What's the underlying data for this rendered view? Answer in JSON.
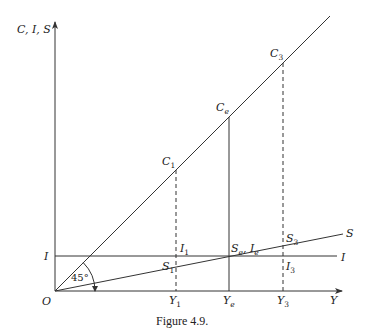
{
  "figure": {
    "caption": "Figure 4.9.",
    "y_axis_label": "C, I, S",
    "x_axis_label": "Y",
    "origin_label": "O",
    "angle_label": "45°",
    "i_axis_label": "I",
    "lines": {
      "consumption": {
        "name": "C",
        "description": "45-degree line"
      },
      "saving": {
        "name": "S",
        "end_label": "S"
      },
      "investment": {
        "name": "I",
        "end_label": "I"
      }
    },
    "points": {
      "c1": {
        "base": "C",
        "sub": "1"
      },
      "ce": {
        "base": "C",
        "sub": "e"
      },
      "c3": {
        "base": "C",
        "sub": "3"
      },
      "i1": {
        "base": "I",
        "sub": "1"
      },
      "s1": {
        "base": "S",
        "sub": "1"
      },
      "se_ie": {
        "base1": "S",
        "sub1": "e",
        "sep": ", ",
        "base2": "I",
        "sub2": "e"
      },
      "s3": {
        "base": "S",
        "sub": "3"
      },
      "i3": {
        "base": "I",
        "sub": "3"
      }
    },
    "x_ticks": [
      {
        "base": "Y",
        "sub": "1"
      },
      {
        "base": "Y",
        "sub": "e"
      },
      {
        "base": "Y",
        "sub": "3"
      }
    ]
  }
}
